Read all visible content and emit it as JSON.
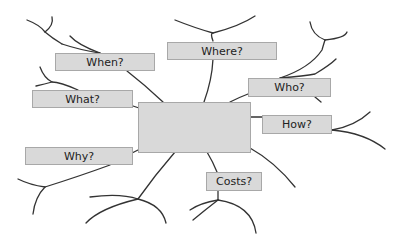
{
  "diagram": {
    "type": "mind-map",
    "center": {
      "label": ""
    },
    "nodes": [
      {
        "id": "when",
        "label": "When?"
      },
      {
        "id": "where",
        "label": "Where?"
      },
      {
        "id": "what",
        "label": "What?"
      },
      {
        "id": "who",
        "label": "Who?"
      },
      {
        "id": "how",
        "label": "How?"
      },
      {
        "id": "why",
        "label": "Why?"
      },
      {
        "id": "costs",
        "label": "Costs?"
      }
    ]
  },
  "colors": {
    "box_fill": "#d9d9d9",
    "box_border": "#a8a8a8",
    "line": "#333333",
    "text": "#222222"
  }
}
